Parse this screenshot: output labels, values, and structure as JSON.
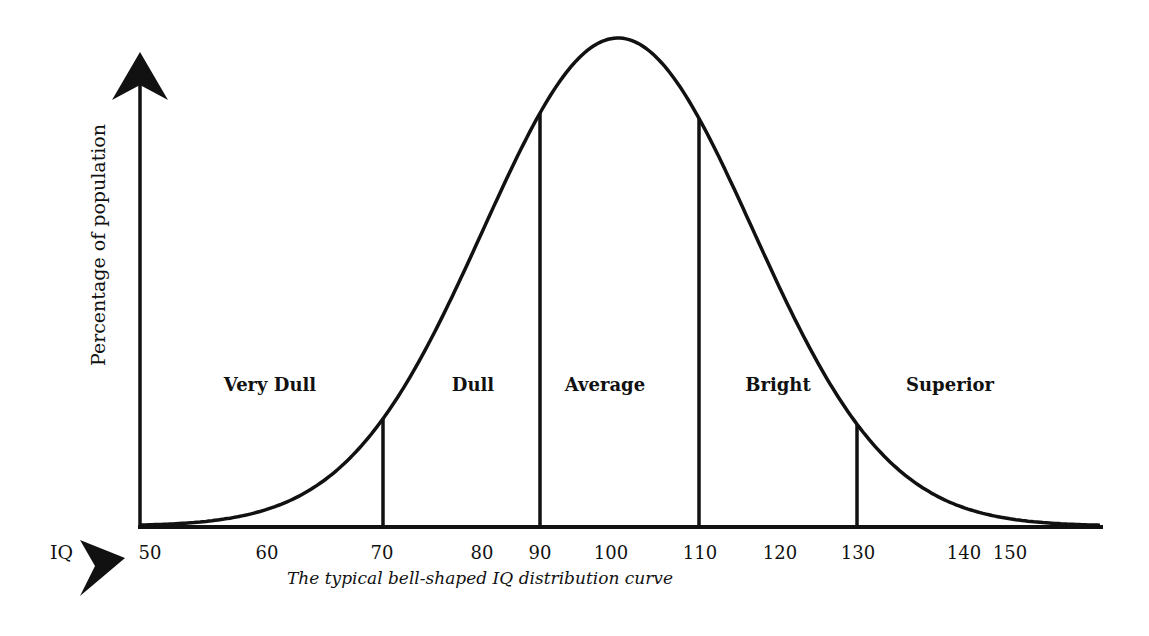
{
  "chart_data": {
    "type": "line",
    "title": "",
    "caption": "The typical bell-shaped IQ distribution curve",
    "xlabel": "IQ",
    "ylabel": "Percentage of population",
    "x_ticks": [
      50,
      60,
      70,
      80,
      90,
      100,
      110,
      120,
      130,
      140,
      150
    ],
    "xlim": [
      50,
      155
    ],
    "grid": false,
    "legend": null,
    "distribution": {
      "shape": "normal",
      "mean": 100,
      "sd": 15
    },
    "boundaries": [
      70,
      90,
      110,
      130
    ],
    "regions": [
      {
        "label": "Very Dull",
        "range": [
          50,
          70
        ]
      },
      {
        "label": "Dull",
        "range": [
          70,
          90
        ]
      },
      {
        "label": "Average",
        "range": [
          90,
          110
        ]
      },
      {
        "label": "Bright",
        "range": [
          110,
          130
        ]
      },
      {
        "label": "Superior",
        "range": [
          130,
          150
        ]
      }
    ]
  },
  "colors": {
    "line": "#111111",
    "background": "#ffffff"
  }
}
